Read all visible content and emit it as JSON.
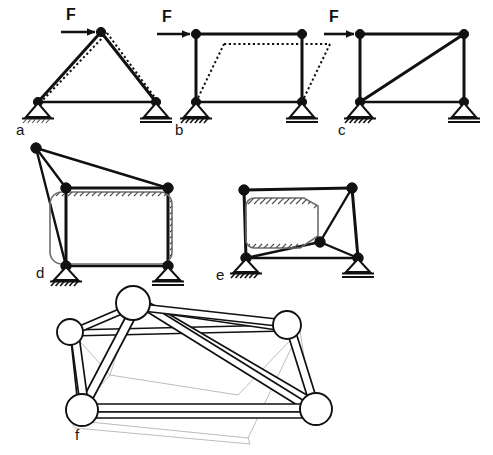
{
  "sheet": {
    "title": "Structural bracing and stability of frames",
    "background_color": "#ffffff",
    "ink_color": "#111111",
    "hatch_color": "#4c4c4c",
    "ghost_color": "#b4b4b4",
    "width": 493,
    "height": 455
  },
  "figures": [
    {
      "key": "a",
      "label": "a",
      "caption": "Triangulated pin-jointed truss with horizontal load F at apex",
      "force_label": "F",
      "supports": [
        "pinned",
        "roller"
      ],
      "has_deformed_shape": true,
      "deformation_type": "elastic-axial",
      "members": 3,
      "nodes": 3
    },
    {
      "key": "b",
      "label": "b",
      "caption": "Unbraced rectangular frame with horizontal load F, sways into parallelogram",
      "force_label": "F",
      "supports": [
        "pinned",
        "roller"
      ],
      "has_deformed_shape": true,
      "deformation_type": "sway-mechanism",
      "members": 4,
      "nodes": 4
    },
    {
      "key": "c",
      "label": "c",
      "caption": "Rectangular frame stabilised by a diagonal brace, load F at top left",
      "force_label": "F",
      "supports": [
        "pinned",
        "roller"
      ],
      "has_deformed_shape": false,
      "deformation_type": "stable",
      "members": 5,
      "nodes": 4
    },
    {
      "key": "d",
      "label": "d",
      "caption": "Frame with rectangular infill shear panel and outrigger node tied by three bars",
      "force_label": "",
      "supports": [
        "pinned",
        "roller"
      ],
      "has_deformed_shape": false,
      "deformation_type": "stable",
      "members": 7,
      "nodes": 5
    },
    {
      "key": "e",
      "label": "e",
      "caption": "Frame with irregular infill shear panel and interior node tied by bars",
      "force_label": "",
      "supports": [
        "pinned",
        "roller"
      ],
      "has_deformed_shape": false,
      "deformation_type": "stable",
      "members": 7,
      "nodes": 5
    },
    {
      "key": "f",
      "label": "f",
      "caption": "Three-dimensional space frame of tubular members with spherical ball joints",
      "force_label": "",
      "supports": [],
      "has_deformed_shape": false,
      "deformation_type": "stable",
      "members": 13,
      "nodes": 5
    }
  ],
  "legend": {
    "pinned_support_name": "pinned-support",
    "roller_support_name": "roller-support",
    "node_name": "pin-joint-node",
    "deformed_name": "deformed-shape-dotted",
    "panel_name": "hatched-infill-panel",
    "ball_joint_name": "ball-joint-node",
    "tube_name": "tubular-member"
  }
}
